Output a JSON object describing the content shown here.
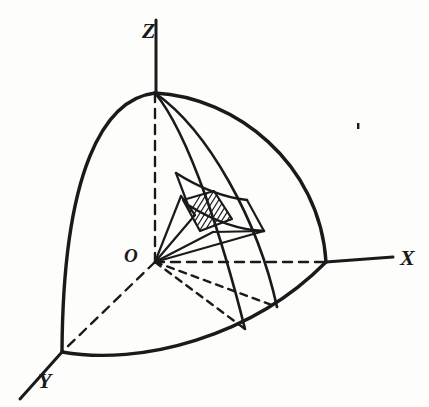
{
  "figure": {
    "kind": "line-drawing",
    "background_color": "#fdfdfc",
    "ink_color": "#1a1a1a",
    "width": 429,
    "height": 407
  },
  "labels": {
    "z_axis": "Z",
    "x_axis": "X",
    "y_axis": "Y",
    "origin": "O"
  },
  "label_positions": {
    "z_axis": {
      "x": 142,
      "y": 38
    },
    "x_axis": {
      "x": 400,
      "y": 265
    },
    "y_axis": {
      "x": 38,
      "y": 388
    },
    "origin": {
      "x": 124,
      "y": 262
    }
  },
  "geometry": {
    "origin": {
      "x": 155,
      "y": 262
    },
    "pole": {
      "x": 155,
      "y": 93
    },
    "x_surface": {
      "x": 326,
      "y": 262
    },
    "y_surface": {
      "x": 62,
      "y": 352
    },
    "x_axis_tip": {
      "x": 393,
      "y": 257
    },
    "y_axis_tip": {
      "x": 20,
      "y": 399
    },
    "z_axis_tip": {
      "x": 156,
      "y": 20
    },
    "meridian_foot_a": {
      "x": 245,
      "y": 329
    },
    "meridian_foot_b": {
      "x": 277,
      "y": 307
    },
    "patch_center": {
      "x": 205,
      "y": 222
    }
  },
  "strokes": {
    "outer_boundary_width": 3.4,
    "meridian_width": 2.6,
    "axis_solid_width": 3.0,
    "dashed_width": 2.4,
    "element_width": 2.2,
    "hatch_width": 1.2,
    "dash_pattern": "9 7",
    "dash_pattern_fine": "7 6"
  },
  "paths": {
    "limb_left": "M 155 93 C 104 99, 63 170, 62 352",
    "limb_right": "M 155 93 C 235 97, 320 163, 326 262",
    "equator_front": "M 62 352 C 140 366, 252 337, 326 262",
    "meridian_inner": "M 155 93 C 190 135, 224 245, 245 329",
    "meridian_outer": "M 155 93 C 208 130, 258 220, 277 307",
    "latitude_upper": "M 176 173 C 195 185, 220 197, 247 200",
    "latitude_lower": "M 188 205 C 209 218, 236 230, 264 231",
    "radial_dash_to_foot_a": "M 155 262 L 245 329",
    "radial_dash_to_foot_b": "M 155 262 L 277 307",
    "radial_dash_to_y": "M 155 262 L 62 352",
    "z_dashed": "M 155 262 L 155 93",
    "z_solid": "M 156 93 L 156 20",
    "x_dashed": "M 155 262 L 326 262",
    "x_solid": "M 326 262 L 393 257",
    "y_solid": "M 62 352 L 20 399",
    "cone_edge_upper": "M 155 262 L 181 196",
    "cone_edge_lower": "M 155 262 L 195 215",
    "cone_edge_bottom": "M 155 262 L 213 232",
    "cone_edge_far": "M 155 262 L 264 231",
    "element_ribs": [
      "M 176 173 L 188 205",
      "M 247 200 L 264 231",
      "M 181 196 L 195 215",
      "M 213 232 L 264 231"
    ],
    "patch_quad": "M 183 200 L 214 191 L 232 219 L 200 231 Z",
    "speck": {
      "x": 357,
      "y": 123,
      "w": 2.4,
      "h": 6
    }
  },
  "hatching": {
    "count": 9,
    "angle_deg": -58,
    "spacing_px": 4.5,
    "color": "#1a1a1a"
  },
  "annotations": {
    "description": "Octant of a sphere with Z vertical, X to the right, Y toward lower-left; two meridian arcs and two latitude arcs bound a shaded surface element, joined to the origin by a narrow radial wedge.",
    "axes": [
      "X",
      "Y",
      "Z"
    ],
    "origin_symbol": "O",
    "shaded_element": "hatched spherical surface patch"
  }
}
